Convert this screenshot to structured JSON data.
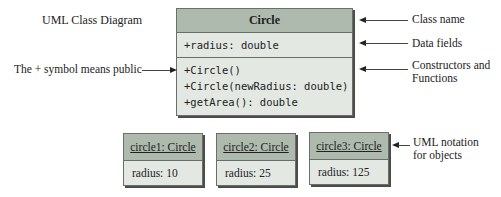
{
  "title": "UML Class Diagram",
  "class_box": {
    "name": "Circle",
    "fields": [
      "+radius: double"
    ],
    "methods": [
      "+Circle()",
      "+Circle(newRadius: double)",
      "+getArea(): double"
    ]
  },
  "annotations": {
    "class_name": "Class name",
    "data_fields": "Data fields",
    "constructors_line1": "Constructors and",
    "constructors_line2": "Functions",
    "public_symbol": "The + symbol means public",
    "uml_objects_line1": "UML notation",
    "uml_objects_line2": "for objects"
  },
  "objects": [
    {
      "name": "circle1: Circle",
      "field": "radius: 10"
    },
    {
      "name": "circle2: Circle",
      "field": "radius: 25"
    },
    {
      "name": "circle3: Circle",
      "field": "radius: 125"
    }
  ],
  "colors": {
    "header": "#aebaae",
    "body": "#e3e8e3",
    "border": "#6a6f6a"
  }
}
